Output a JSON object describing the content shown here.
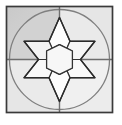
{
  "figure": {
    "canvas": {
      "width": 122,
      "height": 125,
      "background": "#ffffff"
    },
    "frame": {
      "shape": "square",
      "x": 6.5,
      "y": 6.5,
      "width": 106,
      "height": 106,
      "stroke": "#3a3a3a",
      "stroke_width": 1.6,
      "fill": "#e2e2e2"
    },
    "quadrant_shading": {
      "note": "upper-left quadrant rendered darker than the other three",
      "upper_left_fill": "#cfcfcf",
      "upper_right_fill": "#e6e6e6",
      "lower_left_fill": "#e6e6e6",
      "lower_right_fill": "#ececec"
    },
    "circle": {
      "shape": "inscribed-circle",
      "cx": 59.5,
      "cy": 59.5,
      "r": 50,
      "stroke": "#7a7a7a",
      "stroke_width": 1.3,
      "fill": "#e9e9e9"
    },
    "axes": {
      "vertical": {
        "x": 59.5,
        "y1": 6.5,
        "y2": 112.5
      },
      "horizontal": {
        "y": 59.5,
        "x1": 6.5,
        "x2": 112.5
      },
      "stroke": "#6e6e6e",
      "stroke_width": 1.3
    },
    "star": {
      "shape": "hexagram",
      "points": 6,
      "cx": 59.5,
      "cy": 59.5,
      "outer_radius": 42,
      "inner_radius": 21,
      "orientation_deg": -90,
      "stroke": "#2b2b2b",
      "stroke_width": 1.5,
      "fill": "#fbfbfb"
    },
    "dissection": {
      "center_piece": "hexagon",
      "center_hexagon_radius": 12.8,
      "center_hexagon_fill": "#f7f7f7",
      "surrounding_pieces": 6,
      "piece_fill": "#fafafa",
      "piece_stroke": "#3a3a3a",
      "piece_stroke_width": 1.2
    }
  }
}
